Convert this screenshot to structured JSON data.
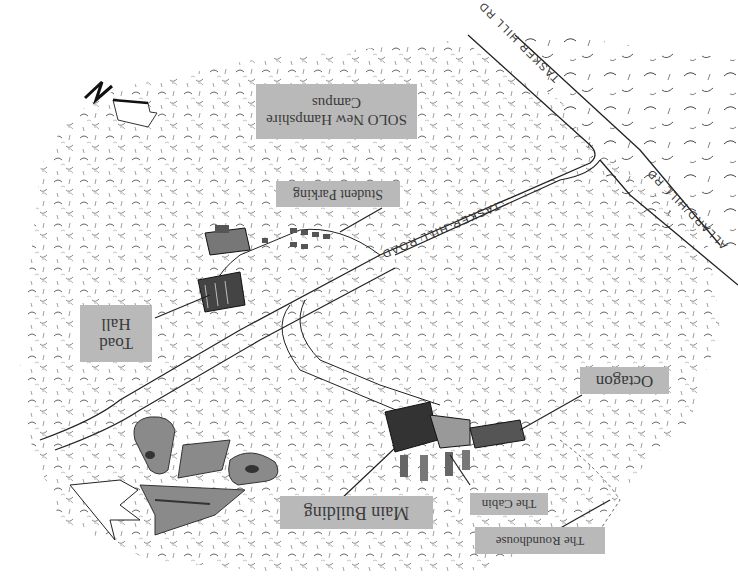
{
  "map": {
    "orientation": "rotated-180",
    "background_color": "#ffffff",
    "label_bg_color": "#b9b9b9",
    "label_text_color": "#3a3a3a",
    "line_color": "#222222"
  },
  "labels": {
    "campus": {
      "line1": "SOLO New Hampshire",
      "line2": "Campus"
    },
    "student_parking": {
      "text": "Student Parking"
    },
    "toad_hall": {
      "line1": "Toad",
      "line2": "Hall"
    },
    "octagon": {
      "text": "Octagon"
    },
    "main_building": {
      "text": "Main Building"
    },
    "the_cabin": {
      "text": "The Cabin"
    },
    "the_roundhouse": {
      "text": "The Roundhouse"
    }
  },
  "roads": {
    "tasker_hill_rd": "TASKER HILL RD",
    "allard_hill_rd": "ALLARD HILL RD",
    "tasker_hill_road": "TASKER HILL ROAD"
  },
  "compass": {
    "icon": "north-arrow-icon",
    "letter": "N"
  },
  "logo": {
    "icon": "solo-logo-icon",
    "text": "SOLO"
  }
}
